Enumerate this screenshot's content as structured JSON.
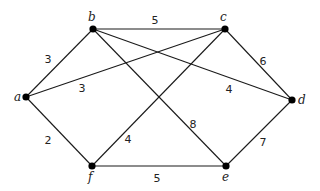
{
  "diagram": {
    "type": "weighted-undirected-graph",
    "nodes": [
      {
        "id": "a",
        "label": "a",
        "x": 26,
        "y": 97,
        "lx": 14,
        "ly": 101
      },
      {
        "id": "b",
        "label": "b",
        "x": 93,
        "y": 29,
        "lx": 88,
        "ly": 21
      },
      {
        "id": "c",
        "label": "c",
        "x": 225,
        "y": 29,
        "lx": 220,
        "ly": 21
      },
      {
        "id": "d",
        "label": "d",
        "x": 292,
        "y": 100,
        "lx": 298,
        "ly": 104
      },
      {
        "id": "e",
        "label": "e",
        "x": 226,
        "y": 166,
        "lx": 222,
        "ly": 181
      },
      {
        "id": "f",
        "label": "f",
        "x": 92,
        "y": 166,
        "lx": 88,
        "ly": 181
      }
    ],
    "edges": [
      {
        "from": "a",
        "to": "b",
        "weight": "3",
        "wx": 48,
        "wy": 63
      },
      {
        "from": "a",
        "to": "c",
        "weight": "3",
        "wx": 82,
        "wy": 92
      },
      {
        "from": "a",
        "to": "f",
        "weight": "2",
        "wx": 48,
        "wy": 144
      },
      {
        "from": "b",
        "to": "c",
        "weight": "5",
        "wx": 155,
        "wy": 24
      },
      {
        "from": "b",
        "to": "d",
        "weight": "4",
        "wx": 229,
        "wy": 93
      },
      {
        "from": "b",
        "to": "e",
        "weight": "8",
        "wx": 193,
        "wy": 128
      },
      {
        "from": "c",
        "to": "d",
        "weight": "6",
        "wx": 263,
        "wy": 65
      },
      {
        "from": "c",
        "to": "f",
        "weight": "4",
        "wx": 128,
        "wy": 143
      },
      {
        "from": "d",
        "to": "e",
        "weight": "7",
        "wx": 263,
        "wy": 146
      },
      {
        "from": "f",
        "to": "e",
        "weight": "5",
        "wx": 157,
        "wy": 182
      }
    ]
  }
}
